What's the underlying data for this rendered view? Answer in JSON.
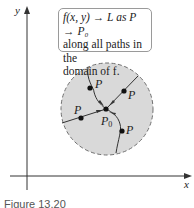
{
  "callout": {
    "line1": "f(x, y) → L as P → P₀",
    "line2": "along all paths in the",
    "line3": "domain of f."
  },
  "axes": {
    "x_label": "x",
    "y_label": "y"
  },
  "points": {
    "p_label": "P",
    "p0_label": "P",
    "p0_sub": "0"
  },
  "caption": "Figure 13.20",
  "colors": {
    "disk_fill": "#d9d9d9",
    "disk_border": "#707070",
    "path": "#333333"
  }
}
